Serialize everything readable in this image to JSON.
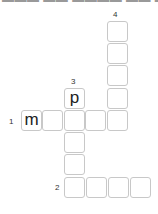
{
  "header": {
    "cutoff_text": "▬▬▬ ▬▬ ▬▬▬▬ ▬▬ ▬▬"
  },
  "clues": [
    {
      "number": "1",
      "direction": "across",
      "length": 5,
      "start": {
        "row": 4,
        "col": 0
      }
    },
    {
      "number": "2",
      "direction": "across",
      "length": 4,
      "start": {
        "row": 7,
        "col": 2
      }
    },
    {
      "number": "3",
      "direction": "down",
      "length": 5,
      "start": {
        "row": 3,
        "col": 2
      }
    },
    {
      "number": "4",
      "direction": "down",
      "length": 5,
      "start": {
        "row": 0,
        "col": 4
      }
    }
  ],
  "labels": {
    "n1": "1",
    "n2": "2",
    "n3": "3",
    "n4": "4"
  },
  "cells": {
    "r0c4": "",
    "r1c4": "",
    "r2c4": "",
    "r3c2": "p",
    "r3c4": "",
    "r4c0": "m",
    "r4c1": "",
    "r4c2": "",
    "r4c3": "",
    "r4c4": "",
    "r5c2": "",
    "r6c2": "",
    "r7c2": "",
    "r7c3": "",
    "r7c4": "",
    "r7c5": ""
  },
  "colors": {
    "cell_border": "#c8c8c8",
    "letter": "#222222",
    "background": "#ffffff"
  }
}
